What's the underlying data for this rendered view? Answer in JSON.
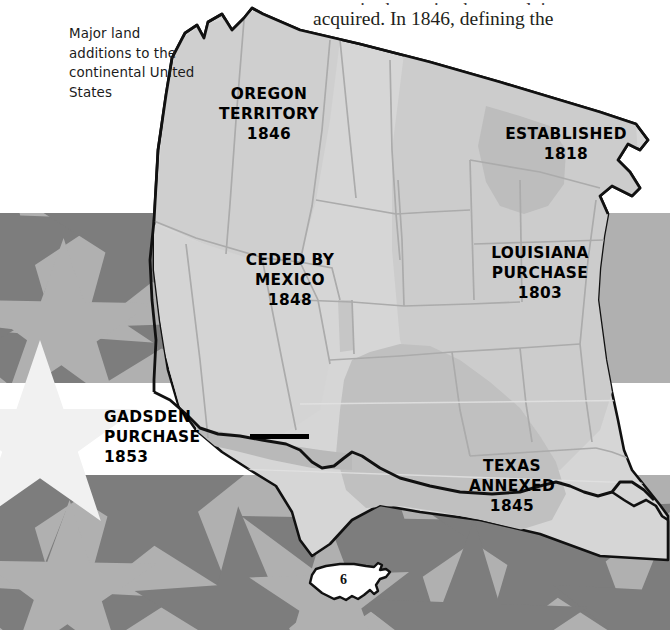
{
  "page": {
    "page_number": "6",
    "background_colors": {
      "stripe_light": "#b0b0b0",
      "stripe_white": "#ffffff",
      "star_dark": "#7d7d7d",
      "paper_white": "#ffffff"
    },
    "map_colors": {
      "land_light": "#d3d3d3",
      "land_mid": "#c3c3c3",
      "land_dark": "#b4b4b4",
      "outline": "#111111",
      "state_border": "#a9a9a9"
    }
  },
  "caption": {
    "clipped_line": "terest in the region but no claim was",
    "line": "acquired. In 1846, defining the"
  },
  "legend": {
    "text": "Major land additions to the continental United States"
  },
  "map_labels": [
    {
      "id": "oregon",
      "lines": [
        "OREGON",
        "TERRITORY",
        "1846"
      ]
    },
    {
      "id": "established",
      "lines": [
        "ESTABLISHED",
        "1818"
      ]
    },
    {
      "id": "mexico",
      "lines": [
        "CEDED BY",
        "MEXICO",
        "1848"
      ]
    },
    {
      "id": "louisiana",
      "lines": [
        "LOUISIANA",
        "PURCHASE",
        "1803"
      ]
    },
    {
      "id": "texas",
      "lines": [
        "TEXAS",
        "ANNEXED",
        "1845"
      ]
    },
    {
      "id": "gadsden",
      "lines": [
        "GADSDEN",
        "PURCHASE",
        "1853"
      ]
    }
  ],
  "labels": {
    "oregon": {
      "l1": "OREGON",
      "l2": "TERRITORY",
      "l3": "1846"
    },
    "established": {
      "l1": "ESTABLISHED",
      "l2": "1818"
    },
    "mexico": {
      "l1": "CEDED BY",
      "l2": "MEXICO",
      "l3": "1848"
    },
    "louisiana": {
      "l1": "LOUISIANA",
      "l2": "PURCHASE",
      "l3": "1803"
    },
    "texas": {
      "l1": "TEXAS",
      "l2": "ANNEXED",
      "l3": "1845"
    },
    "gadsden": {
      "l1": "GADSDEN",
      "l2": "PURCHASE",
      "l3": "1853"
    }
  }
}
